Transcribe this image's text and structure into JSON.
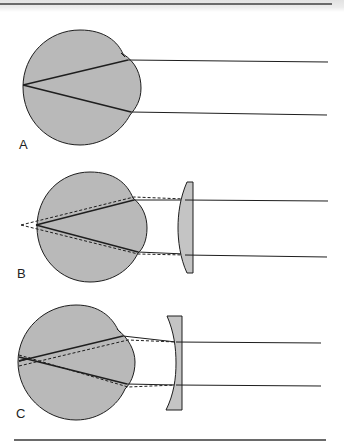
{
  "figure": {
    "panels": [
      {
        "label": "A",
        "description": "Emmetropic eye: parallel rays focus on retina",
        "lens": "none"
      },
      {
        "label": "B",
        "description": "Hyperopic eye corrected with convex (plus) lens; dashed rays show uncorrected focus behind retina",
        "lens": "convex"
      },
      {
        "label": "C",
        "description": "Myopic eye corrected with concave (minus) lens; dashed rays show corrected focus on retina",
        "lens": "concave"
      }
    ],
    "colors": {
      "eye_fill": "#b9b9b9",
      "lens_fill": "#c4c4c4",
      "stroke": "#1e1e1e",
      "rule": "#6a6a6a"
    }
  }
}
